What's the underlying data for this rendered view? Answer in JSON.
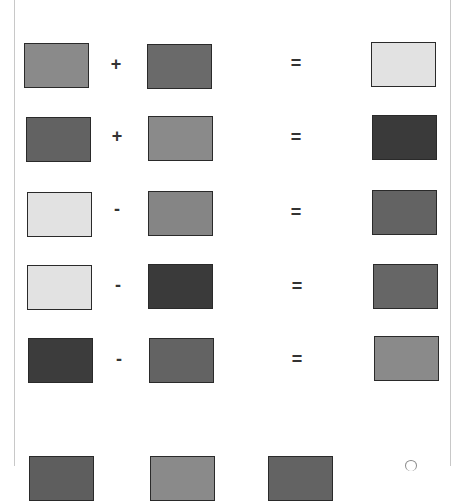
{
  "rows": [
    {
      "a": {
        "color": "#8a8a8a"
      },
      "op": "+",
      "b": {
        "color": "#6a6a6a"
      },
      "eq": "=",
      "result": {
        "color": "#e2e2e2"
      }
    },
    {
      "a": {
        "color": "#626262"
      },
      "op": "+",
      "b": {
        "color": "#8a8a8a"
      },
      "eq": "=",
      "result": {
        "color": "#3a3a3a"
      }
    },
    {
      "a": {
        "color": "#e2e2e2"
      },
      "op": "-",
      "b": {
        "color": "#858585"
      },
      "eq": "=",
      "result": {
        "color": "#636363"
      }
    },
    {
      "a": {
        "color": "#e2e2e2"
      },
      "op": "-",
      "b": {
        "color": "#3a3a3a"
      },
      "eq": "=",
      "result": {
        "color": "#666666"
      }
    },
    {
      "a": {
        "color": "#3c3c3c"
      },
      "op": "-",
      "b": {
        "color": "#636363"
      },
      "eq": "=",
      "result": {
        "color": "#8a8a8a"
      }
    }
  ],
  "partial_row": [
    {
      "color": "#5e5e5e"
    },
    {
      "color": "#8a8a8a"
    },
    {
      "color": "#636363"
    }
  ]
}
